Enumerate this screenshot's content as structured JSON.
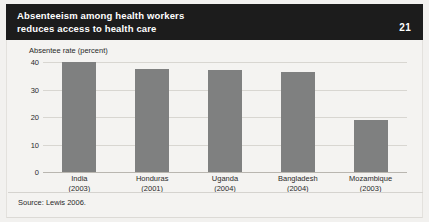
{
  "header": {
    "title_line1": "Absenteeism among health workers",
    "title_line2": "reduces access to health care",
    "number": "21",
    "background_color": "#1c1c1c",
    "text_color": "#ffffff"
  },
  "source": "Source: Lewis 2006.",
  "colors": {
    "bar": "#7f8080",
    "panel": "#f4f3f1",
    "gridline": "#d8d6d1",
    "text": "#2a2a2a"
  },
  "chart_data": {
    "type": "bar",
    "title": "Absenteeism among health workers reduces access to health care",
    "xlabel": "",
    "ylabel": "Absentee rate (percent)",
    "ylim": [
      0,
      40
    ],
    "yticks": [
      0,
      10,
      20,
      30,
      40
    ],
    "grid": true,
    "legend": "none",
    "categories": [
      "India",
      "Honduras",
      "Uganda",
      "Bangladesh",
      "Mozambique"
    ],
    "years": [
      "(2003)",
      "(2001)",
      "(2004)",
      "(2004)",
      "(2003)"
    ],
    "values": [
      40,
      37.5,
      37,
      36.5,
      19
    ]
  }
}
